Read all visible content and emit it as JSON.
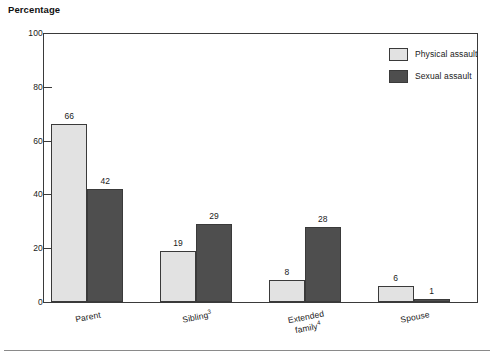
{
  "chart_data": {
    "type": "bar",
    "title": "Percentage",
    "xlabel": "",
    "ylabel": "Percentage",
    "ylim": [
      0,
      100
    ],
    "yticks": [
      0,
      20,
      40,
      60,
      80,
      100
    ],
    "ytick_labels": [
      "0",
      "20",
      "40",
      "60",
      "80",
      "100"
    ],
    "grid": false,
    "legend_position": "top-right",
    "categories": [
      "Parent",
      "Sibling",
      "Extended family",
      "Spouse"
    ],
    "category_labels": [
      {
        "line1": "Parent",
        "line2": "",
        "superscript": ""
      },
      {
        "line1": "Sibling",
        "line2": "",
        "superscript": "3"
      },
      {
        "line1": "Extended",
        "line2": "family",
        "superscript": "4"
      },
      {
        "line1": "Spouse",
        "line2": "",
        "superscript": ""
      }
    ],
    "series": [
      {
        "name": "Physical assault",
        "color": "#e2e2e2",
        "values": [
          66,
          19,
          8,
          6
        ]
      },
      {
        "name": "Sexual assault",
        "color": "#4e4e4e",
        "values": [
          42,
          29,
          28,
          1
        ]
      }
    ],
    "data_labels": {
      "Physical assault": [
        "66",
        "19",
        "8",
        "6"
      ],
      "Sexual assault": [
        "42",
        "29",
        "28",
        "1"
      ]
    }
  },
  "legend": {
    "items": [
      {
        "label": "Physical assault",
        "swatch": "light"
      },
      {
        "label": "Sexual assault",
        "swatch": "dark"
      }
    ]
  },
  "colors": {
    "physical_assault": "#e2e2e2",
    "sexual_assault": "#4e4e4e",
    "axis": "#3a3a3a",
    "text": "#1a1a1a",
    "background": "#ffffff"
  }
}
